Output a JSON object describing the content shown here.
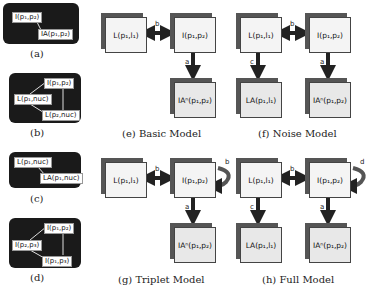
{
  "panels": {
    "a": {
      "caption": "(a)",
      "nodes": [
        "I(p₁,p₂)",
        "IA(p₁,p₂)"
      ]
    },
    "b": {
      "caption": "(b)",
      "nodes": [
        "I(p₁,p₂)",
        "L(p₁,nuc)",
        "L(p₂,nuc)"
      ]
    },
    "c": {
      "caption": "(c)",
      "nodes": [
        "L(p₁,nuc)",
        "LA(p₁,nuc)"
      ]
    },
    "d": {
      "caption": "(d)",
      "nodes": [
        "I(p₁,p₂)",
        "I(p₂,p₃)",
        "I(p₁,p₃)"
      ]
    }
  },
  "models": {
    "e": {
      "caption": "(e) Basic Model",
      "L": "L(p₁,l₁)",
      "I": "I(p₁,p₂)",
      "IA": "IAⁿ(p₁,p₂)",
      "edge_b": "b",
      "edge_a": "a"
    },
    "f": {
      "caption": "(f) Noise Model",
      "L": "L(p₁,l₁)",
      "I": "I(p₁,p₂)",
      "LA": "LA(p₁,l₁)",
      "IA": "IAⁿ(p₁,p₂)",
      "edge_b": "b",
      "edge_c": "c",
      "edge_a": "a"
    },
    "g": {
      "caption": "(g) Triplet Model",
      "L": "L(p₁,l₁)",
      "I": "I(p₁,p₂)",
      "IA": "IAⁿ(p₁,p₂)",
      "edge_b": "b",
      "edge_self": "b",
      "edge_a": "a"
    },
    "h": {
      "caption": "(h) Full Model",
      "L": "L(p₁,l₁)",
      "I": "I(p₁,p₂)",
      "LA": "LA(p₁,l₁)",
      "IA": "IAⁿ(p₁,p₂)",
      "edge_b": "b",
      "edge_self": "d",
      "edge_c": "c",
      "edge_a": "a"
    }
  }
}
